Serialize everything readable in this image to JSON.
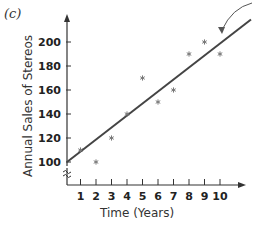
{
  "panel_label": "(c)",
  "chart_data": {
    "type": "scatter",
    "title": "",
    "xlabel": "Time (Years)",
    "ylabel": "Annual Sales of Stereos",
    "x_ticks": [
      1,
      2,
      3,
      4,
      5,
      6,
      7,
      8,
      9,
      10
    ],
    "y_ticks": [
      100,
      120,
      140,
      160,
      180,
      200
    ],
    "xlim": [
      0,
      11
    ],
    "ylim": [
      100,
      220
    ],
    "y_axis_break": true,
    "grid": false,
    "series": [
      {
        "name": "Observed sales",
        "marker": "asterisk",
        "x": [
          1,
          2,
          3,
          4,
          5,
          6,
          7,
          8,
          9,
          10
        ],
        "y": [
          110,
          100,
          120,
          140,
          170,
          150,
          160,
          190,
          200,
          190
        ]
      },
      {
        "name": "Trend line",
        "type": "line",
        "x": [
          0,
          12
        ],
        "y": [
          100,
          220
        ]
      }
    ],
    "annotations": [
      {
        "type": "curved-arrow",
        "points_to": "trend line near x=9.5"
      }
    ]
  }
}
